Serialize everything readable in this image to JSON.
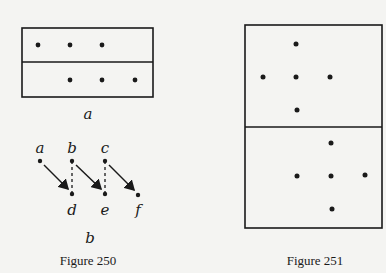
{
  "figure250": {
    "caption": "Figure 250",
    "panel_a": {
      "label": "a",
      "box": {
        "x": 22,
        "y": 28,
        "w": 131,
        "h": 69,
        "divider_y": 62
      },
      "dots_top_row": [
        [
          38,
          45
        ],
        [
          70,
          45
        ],
        [
          102,
          45
        ]
      ],
      "dots_bottom_row": [
        [
          70,
          80
        ],
        [
          102,
          80
        ],
        [
          135,
          80
        ]
      ]
    },
    "panel_b": {
      "label": "b",
      "nodes": [
        {
          "name": "a",
          "x": 40,
          "y": 161,
          "label_y": 148
        },
        {
          "name": "b",
          "x": 72,
          "y": 161,
          "label_y": 148
        },
        {
          "name": "c",
          "x": 105,
          "y": 161,
          "label_y": 148
        },
        {
          "name": "d",
          "x": 72,
          "y": 194,
          "label_y": 210
        },
        {
          "name": "e",
          "x": 105,
          "y": 194,
          "label_y": 210
        },
        {
          "name": "f",
          "x": 138,
          "y": 195,
          "label_y": 210
        }
      ],
      "arrows": [
        [
          "a",
          "d"
        ],
        [
          "b",
          "e"
        ],
        [
          "c",
          "f"
        ]
      ],
      "dashed_lines": [
        [
          "b",
          "d"
        ],
        [
          "c",
          "e"
        ]
      ]
    }
  },
  "figure251": {
    "caption": "Figure 251",
    "box": {
      "x": 245,
      "y": 25,
      "w": 137,
      "h": 203,
      "divider_y": 127
    },
    "top_cross": {
      "center": [
        296,
        77
      ],
      "dots": [
        [
          296,
          44
        ],
        [
          263,
          77
        ],
        [
          296,
          77
        ],
        [
          330,
          77
        ],
        [
          297,
          110
        ]
      ]
    },
    "bottom_cross": {
      "center": [
        331,
        175
      ],
      "dots": [
        [
          331,
          143
        ],
        [
          297,
          176
        ],
        [
          331,
          176
        ],
        [
          365,
          175
        ],
        [
          332,
          209
        ]
      ]
    }
  }
}
